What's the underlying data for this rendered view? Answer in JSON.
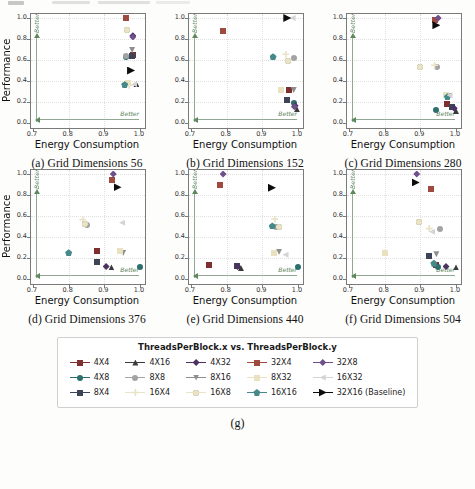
{
  "figure": {
    "caption_g": "(g)"
  },
  "chart_data": {
    "type": "scatter",
    "xlabel": "Energy Consumption",
    "ylabel": "Performance",
    "better_label": "Better",
    "xlim": [
      0.7,
      1.0
    ],
    "ylim": [
      0.0,
      1.0
    ],
    "x_ticks": [
      0.7,
      0.8,
      0.9,
      1.0
    ],
    "y_ticks": [
      0.0,
      0.2,
      0.4,
      0.6,
      0.8,
      1.0
    ],
    "grid": true,
    "legend_title": "ThreadsPerBlock.x vs. ThreadsPerBlock.y",
    "subplots": [
      "(a) Grid Dimensions 56",
      "(b) Grid Dimensions 152",
      "(c) Grid Dimensions 280",
      "(d) Grid Dimensions 376",
      "(e) Grid Dimensions 440",
      "(f) Grid Dimensions 504"
    ],
    "series": [
      {
        "name": "4X4",
        "label": "4X4",
        "marker": "square",
        "color": "#7f2f2f",
        "values": [
          [
            0.981,
            0.65
          ],
          [
            0.975,
            0.31
          ],
          [
            0.975,
            0.18
          ],
          [
            0.88,
            0.27
          ],
          [
            0.75,
            0.135
          ],
          [
            0.943,
            0.135
          ]
        ]
      },
      {
        "name": "4X8",
        "label": "4X8",
        "marker": "circle",
        "color": "#2d6e6e",
        "values": [
          [
            0.962,
            0.625
          ],
          [
            0.988,
            0.195
          ],
          [
            0.945,
            0.12
          ],
          [
            1.0,
            0.11
          ],
          [
            1.0,
            0.11
          ],
          [
            0.95,
            0.115
          ]
        ]
      },
      {
        "name": "8X4",
        "label": "8X4",
        "marker": "square",
        "color": "#3d4456",
        "values": [
          [
            0.978,
            0.64
          ],
          [
            0.969,
            0.22
          ],
          [
            0.988,
            0.155
          ],
          [
            0.88,
            0.16
          ],
          [
            0.828,
            0.125
          ],
          [
            0.925,
            0.22
          ]
        ]
      },
      {
        "name": "4X16",
        "label": "4X16",
        "marker": "triangle-up",
        "color": "#3a3a3a",
        "values": [
          [
            0.99,
            0.37
          ],
          [
            0.997,
            0.13
          ],
          [
            1.0,
            0.115
          ],
          [
            0.92,
            0.11
          ],
          [
            0.84,
            0.105
          ],
          [
            1.0,
            0.11
          ]
        ]
      },
      {
        "name": "8X8",
        "label": "8X8",
        "marker": "circle",
        "color": "#a3a3a3",
        "values": [
          [
            0.96,
            0.635
          ],
          [
            0.99,
            0.62
          ],
          [
            0.948,
            0.535
          ],
          [
            0.852,
            0.51
          ],
          [
            0.937,
            0.5
          ],
          [
            0.955,
            0.48
          ]
        ]
      },
      {
        "name": "16X4",
        "label": "16X4",
        "marker": "plus",
        "color": "#e9e3c8",
        "values": [
          [
            0.97,
            0.36
          ],
          [
            0.966,
            0.655
          ],
          [
            0.94,
            0.55
          ],
          [
            0.84,
            0.565
          ],
          [
            0.935,
            0.57
          ],
          [
            0.925,
            0.48
          ]
        ]
      },
      {
        "name": "4X32",
        "label": "4X32",
        "marker": "diamond",
        "color": "#4c3263",
        "values": [
          [
            0.98,
            0.83
          ],
          [
            0.992,
            0.165
          ],
          [
            0.995,
            0.14
          ],
          [
            0.905,
            0.12
          ],
          [
            0.83,
            0.12
          ],
          [
            0.972,
            0.12
          ]
        ]
      },
      {
        "name": "8X16",
        "label": "8X16",
        "marker": "triangle-down",
        "color": "#8f8f8f",
        "values": [
          [
            0.978,
            0.695
          ],
          [
            0.988,
            0.315
          ],
          [
            0.979,
            0.26
          ],
          [
            0.953,
            0.25
          ],
          [
            0.947,
            0.26
          ],
          [
            0.945,
            0.235
          ]
        ]
      },
      {
        "name": "16X8",
        "label": "16X8",
        "marker": "circle",
        "color": "#eae3c4",
        "values": [
          [
            0.963,
            0.89
          ],
          [
            0.971,
            0.59
          ],
          [
            0.9,
            0.53
          ],
          [
            0.845,
            0.52
          ],
          [
            0.948,
            0.495
          ],
          [
            0.895,
            0.54
          ]
        ]
      },
      {
        "name": "32X4",
        "label": "32X4",
        "marker": "square",
        "color": "#9e4a3f",
        "values": [
          [
            0.962,
            1.0
          ],
          [
            0.79,
            0.88
          ],
          [
            0.94,
            0.985
          ],
          [
            0.922,
            0.945
          ],
          [
            0.78,
            0.9
          ],
          [
            0.929,
            0.855
          ]
        ]
      },
      {
        "name": "8X32",
        "label": "8X32",
        "marker": "square",
        "color": "#e9e2c0",
        "values": [
          [
            0.967,
            0.38
          ],
          [
            0.953,
            0.31
          ],
          [
            0.972,
            0.27
          ],
          [
            0.945,
            0.27
          ],
          [
            0.932,
            0.25
          ],
          [
            0.8,
            0.245
          ]
        ]
      },
      {
        "name": "16X16",
        "label": "16X16",
        "marker": "pentagon",
        "color": "#46898a",
        "values": [
          [
            0.957,
            0.365
          ],
          [
            0.93,
            0.63
          ],
          [
            0.976,
            0.25
          ],
          [
            0.8,
            0.25
          ],
          [
            0.928,
            0.505
          ],
          [
            0.938,
            0.15
          ]
        ]
      },
      {
        "name": "32X8",
        "label": "32X8",
        "marker": "diamond",
        "color": "#6f4f8c",
        "values": [
          [
            0.98,
            0.82
          ],
          [
            0.99,
            0.155
          ],
          [
            0.95,
            1.0
          ],
          [
            0.925,
            1.0
          ],
          [
            0.79,
            1.0
          ],
          [
            0.89,
            1.0
          ]
        ]
      },
      {
        "name": "16X32",
        "label": "16X32",
        "marker": "triangle-left",
        "color": "#d4d4d4",
        "values": [
          [
            0.984,
            0.37
          ],
          [
            0.985,
            1.0
          ],
          [
            0.982,
            0.265
          ],
          [
            0.95,
            0.535
          ],
          [
            0.965,
            0.23
          ],
          [
            0.933,
            0.45
          ]
        ]
      },
      {
        "name": "32X16",
        "label": "32X16 (Baseline)",
        "marker": "triangle-right",
        "color": "#0d0d0d",
        "values": [
          [
            0.975,
            0.5
          ],
          [
            0.97,
            1.0
          ],
          [
            0.945,
            0.93
          ],
          [
            0.937,
            0.875
          ],
          [
            0.927,
            0.87
          ],
          [
            0.887,
            0.92
          ]
        ]
      }
    ]
  }
}
